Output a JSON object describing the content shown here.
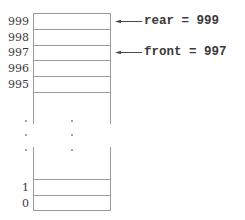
{
  "diagram": {
    "top_slots": [
      {
        "index": "999"
      },
      {
        "index": "998"
      },
      {
        "index": "997"
      },
      {
        "index": "996"
      },
      {
        "index": "995"
      }
    ],
    "bottom_slots": [
      {
        "index": "1"
      },
      {
        "index": "0"
      }
    ],
    "ellipsis": "vertical dots indicating omitted slots",
    "pointers": {
      "rear": {
        "label": "rear = 999",
        "target_index": "999"
      },
      "front": {
        "label": "front = 997",
        "target_index": "997"
      }
    },
    "colors": {
      "line": "#9a9a9a",
      "text": "#3a3a3a",
      "background": "#ffffff"
    }
  }
}
